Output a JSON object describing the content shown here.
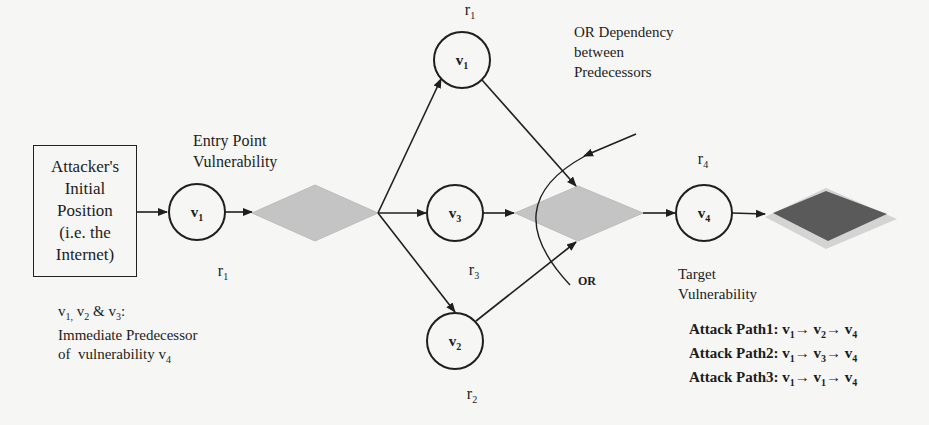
{
  "diagram": {
    "type": "attack-graph",
    "start_box": {
      "lines": [
        "Attacker's",
        "Initial",
        "Position",
        "(i.e. the",
        "Internet)"
      ]
    },
    "nodes": {
      "v1_entry": {
        "main": "v",
        "sub": "1"
      },
      "v1_top": {
        "main": "v",
        "sub": "1"
      },
      "v3": {
        "main": "v",
        "sub": "3"
      },
      "v2": {
        "main": "v",
        "sub": "2"
      },
      "v4": {
        "main": "v",
        "sub": "4"
      }
    },
    "resources": {
      "r1_bottom": {
        "main": "r",
        "sub": "1"
      },
      "r1_top": {
        "main": "r",
        "sub": "1"
      },
      "r3": {
        "main": "r",
        "sub": "3"
      },
      "r2": {
        "main": "r",
        "sub": "2"
      },
      "r4": {
        "main": "r",
        "sub": "4"
      }
    },
    "annotations": {
      "entry_point": [
        "Entry Point",
        "Vulnerability"
      ],
      "or_dependency": [
        "OR Dependency",
        "between",
        "Predecessors"
      ],
      "or_label": "OR",
      "target": [
        "Target",
        "Vulnerability"
      ],
      "predecessor_note": {
        "line1": "v1, v2 & v3:",
        "line2": "Immediate Predecessor",
        "line3": "of  vulnerability v4"
      }
    },
    "attack_paths": [
      {
        "label": "Attack Path1:",
        "path": [
          "v1",
          "v2",
          "v4"
        ]
      },
      {
        "label": "Attack Path2:",
        "path": [
          "v1",
          "v3",
          "v4"
        ]
      },
      {
        "label": "Attack Path3:",
        "path": [
          "v1",
          "v1",
          "v4"
        ]
      }
    ],
    "colors": {
      "condition_diamond": "#c4c4c4",
      "goal_diamond": "#5a5a5a",
      "goal_diamond_edge": "#d4d4d4",
      "stroke": "#1f1f1f",
      "background": "#f6f6f4"
    }
  }
}
